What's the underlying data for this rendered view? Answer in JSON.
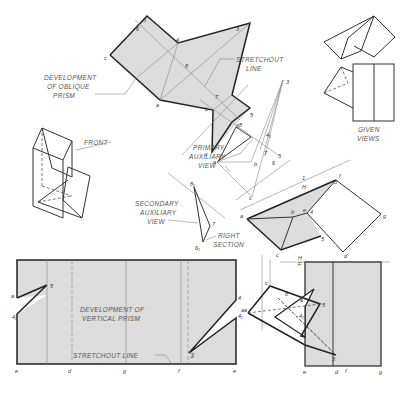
{
  "labels": {
    "development_oblique": [
      "DEVELOPMENT",
      "OF OBLIQUE",
      "PRISM"
    ],
    "stretchout_top": [
      "STRETCHOUT",
      "LINE"
    ],
    "given_views": [
      "GIVEN",
      "VIEWS"
    ],
    "front": "FRONT",
    "primary_aux": [
      "PRIMARY",
      "AUXILIARY",
      "VIEW"
    ],
    "secondary_aux": [
      "SECONDARY",
      "AUXILIARY",
      "VIEW"
    ],
    "right_section": [
      "RIGHT",
      "SECTION"
    ],
    "development_vertical": [
      "DEVELOPMENT OF",
      "VERTICAL PRISM"
    ],
    "stretchout_bottom": "STRETCHOUT LINE",
    "fold_1": "1",
    "fold_H_top": "H",
    "fold_H": "H",
    "fold_F": "F"
  },
  "points": {
    "oblique_dev": {
      "s": "5",
      "six": "6",
      "c": "c",
      "four": "4",
      "eight": "8",
      "a": "a",
      "three": "3",
      "seven": "7",
      "b": "b",
      "five": "5",
      "six_b": "6",
      "c2": "c"
    },
    "aux": {
      "three": "3",
      "eight": "8",
      "four1": "4₁",
      "seven": "7",
      "four": "4",
      "five": "5",
      "b": "b",
      "a": "a",
      "c": "c",
      "six": "6",
      "eight_s": "8₁",
      "seven_s": "7",
      "six_s": "6₁"
    },
    "top_view": {
      "a": "a",
      "b": "b",
      "e": "e",
      "f": "f",
      "four": "4",
      "four1": "4₁",
      "five": "5",
      "c": "c",
      "d": "d",
      "g": "g",
      "three": "3"
    },
    "front_view": {
      "c": "c",
      "b": "b",
      "a": "a",
      "five": "5",
      "four": "4",
      "four1": "4₁",
      "three": "3",
      "e": "e",
      "d": "d",
      "f": "f",
      "g": "g",
      "a1": "a"
    },
    "vertical_dev": {
      "s": "5",
      "a": "a",
      "four1": "4₁",
      "e": "e",
      "d": "d",
      "g": "g",
      "f": "f",
      "e2": "e",
      "four": "4",
      "four1b": "4₁",
      "three": "3",
      "a2": "a"
    }
  }
}
